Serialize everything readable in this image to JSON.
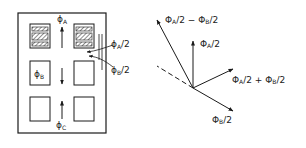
{
  "core_diagram": {
    "flux_labels": {
      "phi_a": {
        "main": "ϕ",
        "sub": "A"
      },
      "phi_b": {
        "main": "ϕ",
        "sub": "B"
      },
      "phi_c": {
        "main": "ϕ",
        "sub": "C"
      },
      "phi_a_half": {
        "main": "ϕ",
        "sub": "A",
        "tail": "/2"
      },
      "phi_b_half": {
        "main": "ϕ",
        "sub": "B",
        "tail": "/2"
      }
    },
    "windows": [
      "upper-left-wound",
      "upper-right-wound",
      "middle-left",
      "middle-right",
      "lower-left",
      "lower-right"
    ]
  },
  "phasor_diagram": {
    "labels": {
      "difference": {
        "p1": "Φ",
        "s1": "A",
        "t1": "/2 − ",
        "p2": "Φ",
        "s2": "B",
        "t2": "/2"
      },
      "a_half": {
        "p1": "Φ",
        "s1": "A",
        "t1": "/2"
      },
      "sum": {
        "p1": "Φ",
        "s1": "A",
        "t1": "/2 + ",
        "p2": "Φ",
        "s2": "B",
        "t2": "/2"
      },
      "b_half": {
        "p1": "Φ",
        "s1": "B",
        "t1": "/2"
      }
    }
  },
  "colors": {
    "ink": "#1a1a1a",
    "background": "#ffffff"
  }
}
